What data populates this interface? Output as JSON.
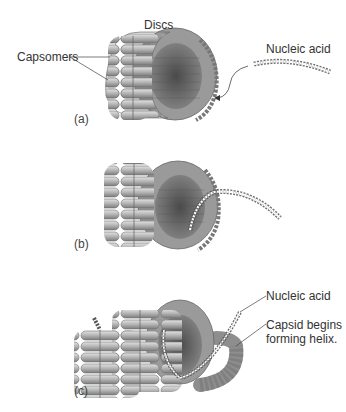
{
  "figure": {
    "panels": [
      {
        "id": "a",
        "label": "(a)",
        "annotations": {
          "discs": "Discs",
          "capsomers": "Capsomers",
          "nucleic_acid": "Nucleic acid"
        }
      },
      {
        "id": "b",
        "label": "(b)"
      },
      {
        "id": "c",
        "label": "(c)",
        "annotations": {
          "nucleic_acid": "Nucleic acid",
          "capsid_helix": "Capsid begins forming helix.",
          "capsid_helix_line1": "Capsid begins",
          "capsid_helix_line2": "forming helix."
        }
      }
    ],
    "colors": {
      "capsomer_light": "#c8c8c8",
      "capsomer_dark": "#7a7a7a",
      "interior": "#5a5a5a",
      "nucleic_acid": "#555555"
    }
  }
}
